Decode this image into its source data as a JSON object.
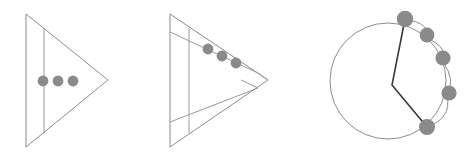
{
  "figure": {
    "width": 466,
    "height": 162,
    "background": "#ffffff",
    "caption": "",
    "panel_count": 3
  },
  "style": {
    "outline_color": "#8c8c8c",
    "outline_width": 1,
    "inner_line_color": "#9a9a9a",
    "inner_line_width": 1,
    "dot_fill": "#8a8a8a",
    "dot_stroke": "none",
    "path_color": "#3a3a3a",
    "path_width": 1.6,
    "circle_stroke": "#8c8c8c",
    "circle_width": 1
  },
  "panels": [
    {
      "id": "panel-1",
      "name": "triangle-upright-with-band",
      "shape": "triangle",
      "triangle": {
        "points": [
          [
            26,
            14
          ],
          [
            26,
            147
          ],
          [
            108,
            80
          ]
        ],
        "label": "right-pointing triangle"
      },
      "inner_lines": [
        {
          "name": "vertical-divider",
          "from": [
            44,
            28
          ],
          "to": [
            44,
            133
          ]
        }
      ],
      "dots": [
        {
          "cx": 43,
          "cy": 81,
          "r": 5.4
        },
        {
          "cx": 58,
          "cy": 81,
          "r": 5.4
        },
        {
          "cx": 73,
          "cy": 81,
          "r": 5.4
        }
      ],
      "dot_count": 3
    },
    {
      "id": "panel-2",
      "name": "triangle-rotated-with-diagonal-band",
      "shape": "triangle",
      "triangle": {
        "points": [
          [
            170,
            14
          ],
          [
            170,
            147
          ],
          [
            268,
            80
          ]
        ],
        "label": "right-pointing triangle with diagonal band"
      },
      "inner_lines": [
        {
          "name": "vertical-divider",
          "from": [
            189,
            28
          ],
          "to": [
            189,
            133
          ]
        },
        {
          "name": "band-upper-edge",
          "from": [
            170,
            32
          ],
          "to": [
            258,
            73
          ]
        },
        {
          "name": "band-lower-edge",
          "from": [
            170,
            122
          ],
          "to": [
            258,
            88
          ]
        },
        {
          "name": "band-cap-upper",
          "from": [
            258,
            73
          ],
          "to": [
            268,
            80
          ]
        },
        {
          "name": "band-cap-lower",
          "from": [
            241,
            80
          ],
          "to": [
            258,
            88
          ]
        }
      ],
      "dots": [
        {
          "cx": 208,
          "cy": 49,
          "r": 5.4
        },
        {
          "cx": 222,
          "cy": 56,
          "r": 5.4
        },
        {
          "cx": 236,
          "cy": 63,
          "r": 5.4
        }
      ],
      "dot_count": 3
    },
    {
      "id": "panel-3",
      "name": "circle-with-arc-dots-and-polyline",
      "shape": "circle",
      "circle": {
        "cx": 388,
        "cy": 81,
        "r": 58
      },
      "polyline": {
        "name": "wedge-path",
        "points": [
          [
            405,
            19
          ],
          [
            392,
            85
          ],
          [
            427,
            127
          ]
        ]
      },
      "arc_curve": {
        "name": "dot-arc",
        "d": "M 405 19 Q 432 24 426 38 Q 448 46 443 62 Q 456 80 447 96 Q 452 118 427 127"
      },
      "dots": [
        {
          "cx": 405,
          "cy": 19,
          "r": 8.2
        },
        {
          "cx": 427,
          "cy": 35,
          "r": 7.4
        },
        {
          "cx": 443,
          "cy": 58,
          "r": 7.6
        },
        {
          "cx": 449,
          "cy": 93,
          "r": 7.6
        },
        {
          "cx": 427,
          "cy": 127,
          "r": 8.0
        }
      ],
      "dot_count": 5
    }
  ]
}
